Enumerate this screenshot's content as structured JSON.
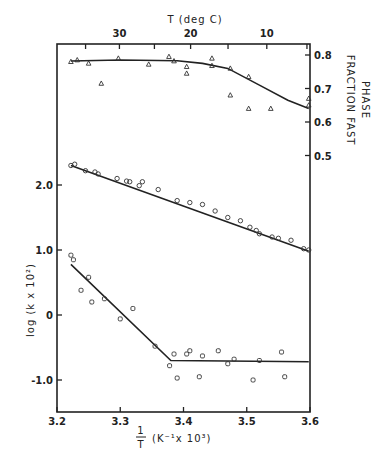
{
  "chart_data": {
    "type": "scatter",
    "title": "",
    "xlabel": "1/T (K^-1 x 10^3)",
    "xlabel_num": "1",
    "xlabel_den": "T",
    "xlabel_unit": "(K⁻¹x 10³)",
    "ylabel_left": "log (k x 10²)",
    "ylabel_right_1": "FRACTION  FAST",
    "ylabel_right_2": "PHASE",
    "xlabel_top": "T (deg C)",
    "xlim": [
      3.2,
      3.6
    ],
    "ylim_left": [
      -1.5,
      3.5
    ],
    "ylim_right": [
      0.5,
      0.83
    ],
    "x_ticks": [
      "3.2",
      "3.3",
      "3.4",
      "3.5",
      "3.6"
    ],
    "y_ticks_left": [
      "2.0",
      "1.0",
      "0",
      "-1.0"
    ],
    "y_ticks_right": [
      "0.8",
      "0.7",
      "0.6",
      "0.5"
    ],
    "x_ticks_top": [
      "30",
      "20",
      "10"
    ],
    "grid": false,
    "series": [
      {
        "name": "Fraction fast phase (triangles, right axis)",
        "marker": "triangle",
        "axis": "right",
        "points": [
          [
            3.222,
            0.78
          ],
          [
            3.232,
            0.785
          ],
          [
            3.25,
            0.775
          ],
          [
            3.27,
            0.715
          ],
          [
            3.297,
            0.79
          ],
          [
            3.345,
            0.772
          ],
          [
            3.377,
            0.795
          ],
          [
            3.385,
            0.782
          ],
          [
            3.405,
            0.765
          ],
          [
            3.405,
            0.745
          ],
          [
            3.445,
            0.79
          ],
          [
            3.445,
            0.768
          ],
          [
            3.474,
            0.76
          ],
          [
            3.474,
            0.68
          ],
          [
            3.503,
            0.735
          ],
          [
            3.503,
            0.64
          ],
          [
            3.538,
            0.64
          ],
          [
            3.598,
            0.67
          ],
          [
            3.598,
            0.65
          ]
        ],
        "fit": [
          [
            3.222,
            0.782
          ],
          [
            3.3,
            0.785
          ],
          [
            3.39,
            0.783
          ],
          [
            3.43,
            0.775
          ],
          [
            3.47,
            0.76
          ],
          [
            3.52,
            0.71
          ],
          [
            3.565,
            0.665
          ],
          [
            3.598,
            0.64
          ]
        ]
      },
      {
        "name": "log k fast (circles, left axis)",
        "marker": "circle",
        "axis": "left",
        "points": [
          [
            3.222,
            2.3
          ],
          [
            3.228,
            2.32
          ],
          [
            3.245,
            2.22
          ],
          [
            3.26,
            2.2
          ],
          [
            3.265,
            2.17
          ],
          [
            3.295,
            2.1
          ],
          [
            3.31,
            2.06
          ],
          [
            3.315,
            2.05
          ],
          [
            3.33,
            1.99
          ],
          [
            3.335,
            2.05
          ],
          [
            3.36,
            1.93
          ],
          [
            3.39,
            1.76
          ],
          [
            3.41,
            1.73
          ],
          [
            3.43,
            1.7
          ],
          [
            3.45,
            1.6
          ],
          [
            3.47,
            1.5
          ],
          [
            3.49,
            1.45
          ],
          [
            3.505,
            1.35
          ],
          [
            3.515,
            1.3
          ],
          [
            3.52,
            1.25
          ],
          [
            3.54,
            1.2
          ],
          [
            3.55,
            1.18
          ],
          [
            3.57,
            1.15
          ],
          [
            3.59,
            1.02
          ],
          [
            3.598,
            1.0
          ]
        ],
        "fit": [
          [
            3.222,
            2.3
          ],
          [
            3.598,
            0.98
          ]
        ]
      },
      {
        "name": "log k slow (squares, left axis)",
        "marker": "square",
        "axis": "left",
        "points": [
          [
            3.222,
            0.92
          ],
          [
            3.226,
            0.85
          ],
          [
            3.238,
            0.38
          ],
          [
            3.25,
            0.58
          ],
          [
            3.255,
            0.2
          ],
          [
            3.275,
            0.25
          ],
          [
            3.3,
            -0.06
          ],
          [
            3.32,
            0.1
          ],
          [
            3.355,
            -0.48
          ],
          [
            3.378,
            -0.78
          ],
          [
            3.385,
            -0.6
          ],
          [
            3.39,
            -0.97
          ],
          [
            3.405,
            -0.6
          ],
          [
            3.41,
            -0.55
          ],
          [
            3.425,
            -0.95
          ],
          [
            3.43,
            -0.63
          ],
          [
            3.455,
            -0.55
          ],
          [
            3.47,
            -0.75
          ],
          [
            3.48,
            -0.68
          ],
          [
            3.51,
            -1.0
          ],
          [
            3.52,
            -0.7
          ],
          [
            3.555,
            -0.57
          ],
          [
            3.56,
            -0.95
          ]
        ],
        "fit": [
          [
            3.222,
            0.78
          ],
          [
            3.38,
            -0.7
          ],
          [
            3.598,
            -0.72
          ]
        ]
      }
    ]
  }
}
